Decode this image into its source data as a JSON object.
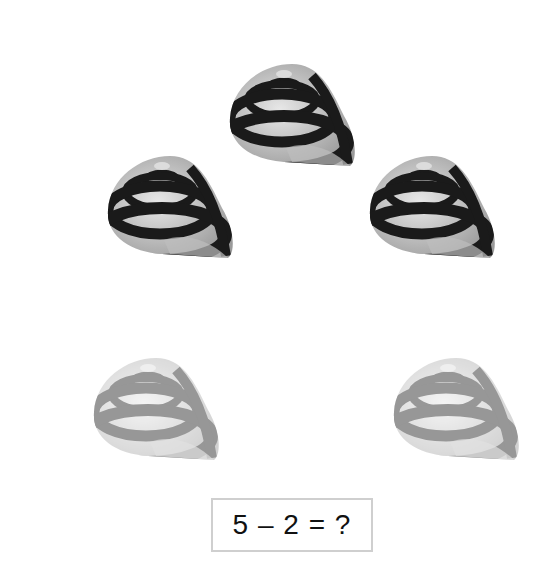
{
  "problem": {
    "equation": "5 – 2 = ?",
    "total_count": 5,
    "removed_count": 2
  },
  "shells": [
    {
      "id": 1,
      "state": "remaining",
      "position": "top-center"
    },
    {
      "id": 2,
      "state": "remaining",
      "position": "middle-left"
    },
    {
      "id": 3,
      "state": "remaining",
      "position": "middle-right"
    },
    {
      "id": 4,
      "state": "removed",
      "position": "bottom-left"
    },
    {
      "id": 5,
      "state": "removed",
      "position": "bottom-right"
    }
  ]
}
